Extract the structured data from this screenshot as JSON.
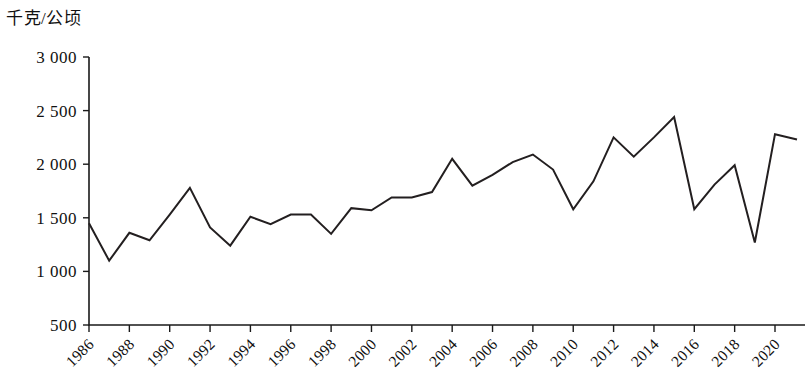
{
  "chart_data": {
    "type": "line",
    "title": "",
    "subtitle": "",
    "ylabel": "千克/公顷",
    "xlabel": "",
    "ylim": [
      500,
      3000
    ],
    "ytick_step": 500,
    "ytick_labels": [
      "3 000",
      "2 500",
      "2 000",
      "1 500",
      "1 000",
      "500"
    ],
    "ytick_values": [
      3000,
      2500,
      2000,
      1500,
      1000,
      500
    ],
    "xlim": [
      1986,
      2020
    ],
    "xtick_labels": [
      "1986",
      "1988",
      "1990",
      "1992",
      "1994",
      "1996",
      "1998",
      "2000",
      "2002",
      "2004",
      "2006",
      "2008",
      "2010",
      "2012",
      "2014",
      "2016",
      "2018",
      "2020"
    ],
    "xtick_values": [
      1986,
      1988,
      1990,
      1992,
      1994,
      1996,
      1998,
      2000,
      2002,
      2004,
      2006,
      2008,
      2010,
      2012,
      2014,
      2016,
      2018,
      2020
    ],
    "xtick_rotation_deg": 45,
    "grid": false,
    "legend": null,
    "legend_position": "none",
    "line_color": "#231f20",
    "markers": false,
    "x": [
      1986,
      1987,
      1988,
      1989,
      1990,
      1991,
      1992,
      1993,
      1994,
      1995,
      1996,
      1997,
      1998,
      1999,
      2000,
      2001,
      2002,
      2003,
      2004,
      2005,
      2006,
      2007,
      2008,
      2009,
      2010,
      2011,
      2012,
      2013,
      2014,
      2015,
      2016,
      2017,
      2018,
      2019,
      2020
    ],
    "values": [
      1450,
      1100,
      1360,
      1290,
      1530,
      1780,
      1410,
      1240,
      1510,
      1440,
      1530,
      1530,
      1350,
      1590,
      1570,
      1690,
      1690,
      1740,
      2050,
      1800,
      1900,
      2020,
      2090,
      1950,
      1580,
      1840,
      2250,
      2070,
      2250,
      2440,
      1580,
      1810,
      1990,
      1270,
      2280
    ],
    "end_value": 2230,
    "series": [
      {
        "name": "",
        "values": [
          1450,
          1100,
          1360,
          1290,
          1530,
          1780,
          1410,
          1240,
          1510,
          1440,
          1530,
          1530,
          1350,
          1590,
          1570,
          1690,
          1690,
          1740,
          2050,
          1800,
          1900,
          2020,
          2090,
          1950,
          1580,
          1840,
          2250,
          2070,
          2250,
          2440,
          1580,
          1810,
          1990,
          1270,
          2280
        ]
      }
    ],
    "annotations": []
  }
}
